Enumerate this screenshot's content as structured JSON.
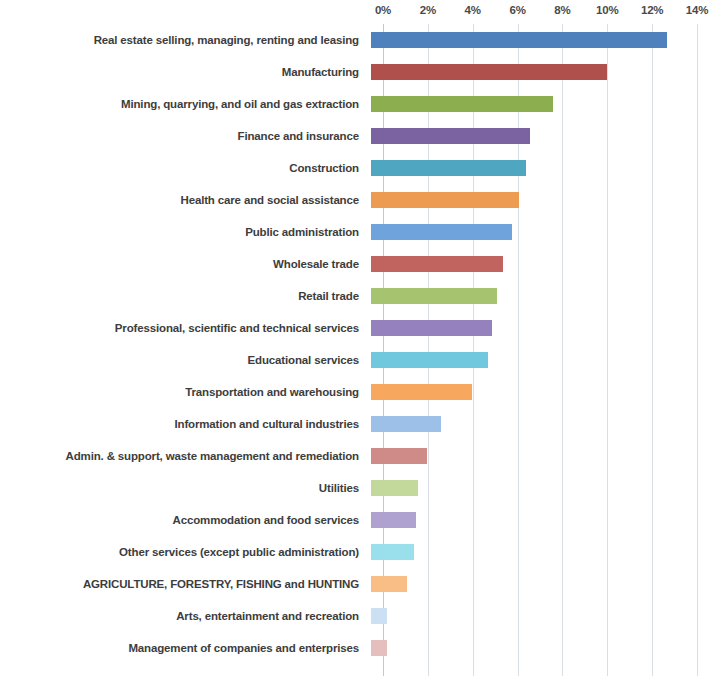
{
  "chart_data": {
    "type": "bar",
    "orientation": "horizontal",
    "title": "",
    "subtitle": "",
    "xlabel": "",
    "ylabel": "",
    "xlim": [
      0,
      14
    ],
    "xtick_labels": [
      "0%",
      "2%",
      "4%",
      "6%",
      "8%",
      "10%",
      "12%",
      "14%"
    ],
    "xticks": [
      0,
      2,
      4,
      6,
      8,
      10,
      12,
      14
    ],
    "grid": "vertical",
    "legend": "none",
    "value_suffix": "%",
    "categories": [
      "Real estate selling, managing, renting and leasing",
      "Manufacturing",
      "Mining, quarrying, and oil and gas extraction",
      "Finance and insurance",
      "Construction",
      "Health care and social assistance",
      "Public administration",
      "Wholesale trade",
      "Retail trade",
      "Professional, scientific and technical services",
      "Educational services",
      "Transportation and warehousing",
      "Information and cultural industries",
      "Admin. & support, waste management and remediation",
      "Utilities",
      "Accommodation and food services",
      "Other services (except public administration)",
      "AGRICULTURE, FORESTRY, FISHING and HUNTING",
      "Arts, entertainment and recreation",
      "Management of companies and enterprises"
    ],
    "values": [
      13.2,
      10.5,
      8.1,
      7.1,
      6.9,
      6.6,
      6.3,
      5.9,
      5.6,
      5.4,
      5.2,
      4.5,
      3.1,
      2.5,
      2.1,
      2.0,
      1.9,
      1.6,
      0.7,
      0.7
    ],
    "colors": [
      "#4F81BD",
      "#B0504C",
      "#8DAE4E",
      "#7B62A0",
      "#4EA6C0",
      "#EE9B52",
      "#6FA3DB",
      "#C1635F",
      "#A6C36F",
      "#9481BE",
      "#6FC8DE",
      "#F7A85E",
      "#9CC0E8",
      "#CE8B87",
      "#C3D89B",
      "#B0A2D0",
      "#9ADFEC",
      "#F9BE86",
      "#CBE0F3",
      "#E5BFBD"
    ],
    "grid_color": "#D8DDE6"
  }
}
